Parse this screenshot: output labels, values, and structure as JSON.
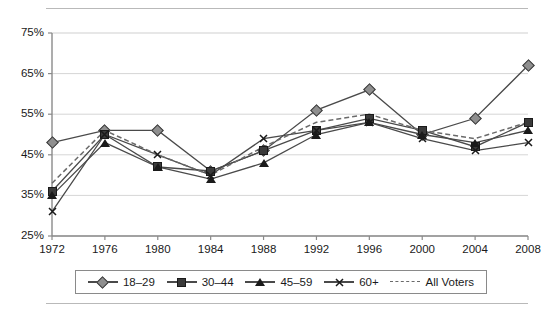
{
  "chart_data": {
    "type": "line",
    "title": "",
    "xlabel": "",
    "ylabel": "",
    "grid": true,
    "legend_position": "bottom",
    "x": [
      1972,
      1976,
      1980,
      1984,
      1988,
      1992,
      1996,
      2000,
      2004,
      2008
    ],
    "categories": [
      "1972",
      "1976",
      "1980",
      "1984",
      "1988",
      "1992",
      "1996",
      "2000",
      "2004",
      "2008"
    ],
    "ylim": [
      25,
      75
    ],
    "yticks": [
      25,
      35,
      45,
      55,
      65,
      75
    ],
    "ytick_labels": [
      "25%",
      "35%",
      "45%",
      "55%",
      "65%",
      "75%"
    ],
    "series": [
      {
        "name": "18–29",
        "marker": "diamond",
        "style": "solid",
        "values": [
          48,
          51,
          51,
          41,
          46,
          56,
          61,
          50,
          54,
          67
        ]
      },
      {
        "name": "30–44",
        "marker": "square",
        "style": "solid",
        "values": [
          36,
          50,
          42,
          41,
          46,
          51,
          54,
          51,
          47,
          53
        ]
      },
      {
        "name": "45–59",
        "marker": "triangle",
        "style": "solid",
        "values": [
          35,
          48,
          42,
          39,
          43,
          50,
          53,
          50,
          48,
          51
        ]
      },
      {
        "name": "60+",
        "marker": "x",
        "style": "solid",
        "values": [
          31,
          50,
          45,
          40,
          49,
          51,
          53,
          49,
          46,
          48
        ]
      },
      {
        "name": "All Voters",
        "marker": "none",
        "style": "dashed",
        "values": [
          38,
          51,
          45,
          40,
          47,
          53,
          55,
          51,
          49,
          53
        ]
      }
    ]
  },
  "legend": {
    "items": [
      {
        "label": "18–29"
      },
      {
        "label": "30–44"
      },
      {
        "label": "45–59"
      },
      {
        "label": "60+"
      },
      {
        "label": "All Voters"
      }
    ]
  },
  "colors": {
    "axis": "#8a8a8a",
    "grid": "#d6d6d6",
    "line": "#4a4a4a",
    "dash": "#6a6a6a",
    "text": "#1a1a1a"
  }
}
